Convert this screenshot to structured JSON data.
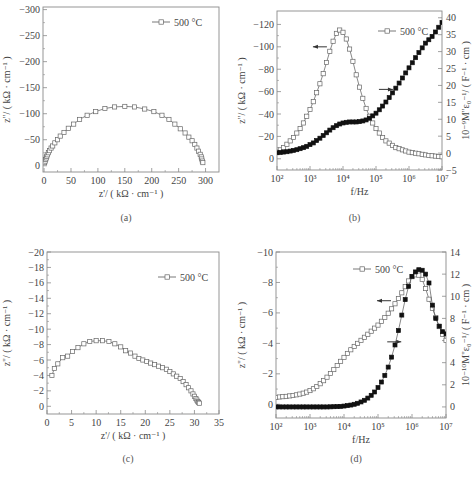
{
  "figure": {
    "captions": [
      "(a)",
      "(b)",
      "(c)",
      "(d)"
    ]
  },
  "chart_data": [
    {
      "id": "a",
      "type": "scatter",
      "title": "",
      "caption": "(a)",
      "xlabel": "z'/ ( kΩ · cm⁻¹ )",
      "ylabel": "z''/ ( kΩ · cm⁻¹ )",
      "xlim": [
        -2,
        325
      ],
      "ylim": [
        12,
        -305
      ],
      "xticks": [
        0,
        50,
        100,
        150,
        200,
        250,
        300
      ],
      "xtick_labels": [
        "0",
        "50",
        "100",
        "150",
        "200",
        "250",
        "300"
      ],
      "yticks": [
        0,
        -50,
        -100,
        -150,
        -200,
        -250,
        -300
      ],
      "ytick_labels": [
        "0",
        "−50",
        "−100",
        "−150",
        "−200",
        "−250",
        "−300"
      ],
      "grid": false,
      "legend": {
        "position": "upper right",
        "entries": [
          "500 °C"
        ]
      },
      "series": [
        {
          "name": "500 °C",
          "marker": "open-square",
          "x": [
            1,
            2,
            3,
            4,
            5,
            6,
            8,
            10,
            13,
            16,
            20,
            25,
            30,
            37,
            45,
            55,
            66,
            80,
            96,
            113,
            131,
            150,
            168,
            187,
            204,
            219,
            232,
            243,
            253,
            262,
            269,
            275,
            280,
            284,
            287,
            290,
            292,
            293,
            294,
            295
          ],
          "y": [
            -6,
            -9,
            -12,
            -15,
            -18,
            -21,
            -25,
            -29,
            -34,
            -38,
            -44,
            -50,
            -57,
            -64,
            -72,
            -80,
            -89,
            -97,
            -104,
            -110,
            -113,
            -114,
            -113,
            -109,
            -104,
            -97,
            -89,
            -80,
            -71,
            -63,
            -55,
            -48,
            -41,
            -34,
            -28,
            -22,
            -17,
            -13,
            -9,
            -6
          ]
        }
      ]
    },
    {
      "id": "b",
      "type": "line",
      "title": "",
      "caption": "(b)",
      "xlabel": "f/Hz",
      "xscale": "log",
      "ylabel": "z''/ ( kΩ · cm⁻¹ )",
      "ylabel_right": "10⁻⁹M''ε₀⁻¹/ ( F⁻¹ · cm )",
      "xlim": [
        100,
        10000000
      ],
      "xticks": [
        100,
        1000,
        10000,
        100000,
        1000000,
        10000000
      ],
      "xtick_labels": [
        "10²",
        "10³",
        "10⁴",
        "10⁵",
        "10⁶",
        "10⁷"
      ],
      "ylim": [
        10,
        -132
      ],
      "yticks": [
        0,
        -20,
        -40,
        -60,
        -80,
        -100,
        -120
      ],
      "ytick_labels": [
        "0",
        "−20",
        "−40",
        "−60",
        "−80",
        "−100",
        "−120"
      ],
      "ylim_right": [
        -5,
        42
      ],
      "yticks_right": [
        -5,
        0,
        5,
        10,
        15,
        20,
        25,
        30,
        35,
        40
      ],
      "ytick_labels_right": [
        "−5",
        "0",
        "5",
        "10",
        "15",
        "20",
        "25",
        "30",
        "35",
        "40"
      ],
      "grid": false,
      "legend": {
        "position": "upper right",
        "entries": [
          "500 °C"
        ]
      },
      "annotations": [
        {
          "text": "←",
          "desc": "arrow pointing to left axis (Z'' curve)",
          "at": [
            2000,
            -100
          ]
        },
        {
          "text": "→",
          "desc": "arrow pointing to right axis (M'' curve)",
          "at": [
            200000,
            -62
          ]
        }
      ],
      "series": [
        {
          "name": "Z'' (500 °C)",
          "axis": "left",
          "marker": "open-square",
          "log10f": [
            2.0,
            2.1,
            2.2,
            2.3,
            2.4,
            2.5,
            2.6,
            2.7,
            2.8,
            2.9,
            3.0,
            3.1,
            3.2,
            3.3,
            3.4,
            3.5,
            3.6,
            3.7,
            3.8,
            3.9,
            4.0,
            4.1,
            4.2,
            4.3,
            4.4,
            4.5,
            4.6,
            4.7,
            4.8,
            4.9,
            5.0,
            5.1,
            5.2,
            5.3,
            5.4,
            5.5,
            5.6,
            5.7,
            5.8,
            5.9,
            6.0,
            6.1,
            6.2,
            6.3,
            6.4,
            6.5,
            6.6,
            6.7,
            6.8,
            6.9,
            7.0
          ],
          "y": [
            -6,
            -8,
            -10,
            -13,
            -16,
            -19,
            -23,
            -27,
            -32,
            -38,
            -44,
            -51,
            -59,
            -67,
            -76,
            -86,
            -96,
            -105,
            -112,
            -115,
            -113,
            -107,
            -98,
            -87,
            -75,
            -64,
            -54,
            -45,
            -38,
            -32,
            -27,
            -23,
            -19,
            -16,
            -14,
            -12,
            -10,
            -9,
            -8,
            -7,
            -6,
            -5.5,
            -5,
            -4.5,
            -4,
            -3.5,
            -3,
            -2.7,
            -2.4,
            -2.1,
            -1.8
          ]
        },
        {
          "name": "M'' (500 °C)",
          "axis": "right",
          "marker": "filled-square",
          "log10f": [
            2.0,
            2.1,
            2.2,
            2.3,
            2.4,
            2.5,
            2.6,
            2.7,
            2.8,
            2.9,
            3.0,
            3.1,
            3.2,
            3.3,
            3.4,
            3.5,
            3.6,
            3.7,
            3.8,
            3.9,
            4.0,
            4.1,
            4.2,
            4.3,
            4.4,
            4.5,
            4.6,
            4.7,
            4.8,
            4.9,
            5.0,
            5.1,
            5.2,
            5.3,
            5.4,
            5.5,
            5.6,
            5.7,
            5.8,
            5.9,
            6.0,
            6.1,
            6.2,
            6.3,
            6.4,
            6.5,
            6.6,
            6.7,
            6.8,
            6.9,
            7.0
          ],
          "y": [
            0.1,
            0.2,
            0.3,
            0.4,
            0.6,
            0.8,
            1.0,
            1.3,
            1.6,
            2.0,
            2.5,
            3.0,
            3.7,
            4.4,
            5.2,
            6.0,
            6.8,
            7.5,
            8.1,
            8.6,
            8.9,
            9.1,
            9.2,
            9.2,
            9.2,
            9.3,
            9.5,
            9.8,
            10.3,
            11.0,
            11.8,
            12.8,
            13.9,
            15.1,
            16.4,
            17.8,
            19.2,
            20.7,
            22.2,
            23.7,
            25.2,
            26.7,
            28.2,
            29.7,
            31.1,
            32.5,
            33.5,
            34.5,
            35.8,
            37.2,
            38.6
          ]
        }
      ]
    },
    {
      "id": "c",
      "type": "scatter",
      "title": "",
      "caption": "(c)",
      "xlabel": "z'/ ( kΩ · cm⁻¹ )",
      "ylabel": "z''/ ( kΩ · cm⁻¹ )",
      "xlim": [
        0,
        35
      ],
      "ylim": [
        1,
        -20
      ],
      "xticks": [
        0,
        5,
        10,
        15,
        20,
        25,
        30,
        35
      ],
      "xtick_labels": [
        "0",
        "5",
        "10",
        "15",
        "20",
        "25",
        "30",
        "35"
      ],
      "yticks": [
        0,
        -2,
        -4,
        -6,
        -8,
        -10,
        -12,
        -14,
        -16,
        -18,
        -20
      ],
      "ytick_labels": [
        "0",
        "−2",
        "−4",
        "−6",
        "−8",
        "−10",
        "−12",
        "−14",
        "−16",
        "−18",
        "−20"
      ],
      "grid": false,
      "legend": {
        "position": "upper right",
        "entries": [
          "500 °C"
        ]
      },
      "series": [
        {
          "name": "500 °C",
          "marker": "open-square",
          "x": [
            1.0,
            1.5,
            2.2,
            3.2,
            4.2,
            5.2,
            6.3,
            7.5,
            8.7,
            10.0,
            11.3,
            12.6,
            13.8,
            15.0,
            16.0,
            17.0,
            17.9,
            18.7,
            19.5,
            20.3,
            21.1,
            21.9,
            22.7,
            23.5,
            24.3,
            25.0,
            25.7,
            26.4,
            27.1,
            27.7,
            28.3,
            28.8,
            29.3,
            29.7,
            30.0,
            30.3,
            30.5,
            30.7,
            30.85,
            31.0
          ],
          "y": [
            -4.0,
            -4.9,
            -5.5,
            -6.3,
            -6.5,
            -7.1,
            -7.6,
            -8.1,
            -8.4,
            -8.5,
            -8.5,
            -8.4,
            -8.1,
            -7.7,
            -7.2,
            -6.9,
            -6.5,
            -6.2,
            -6.0,
            -5.8,
            -5.6,
            -5.4,
            -5.2,
            -5.0,
            -4.8,
            -4.5,
            -4.2,
            -3.9,
            -3.6,
            -3.2,
            -2.8,
            -2.4,
            -2.0,
            -1.6,
            -1.3,
            -1.0,
            -0.8,
            -0.6,
            -0.5,
            -0.4
          ]
        }
      ]
    },
    {
      "id": "d",
      "type": "line",
      "title": "",
      "caption": "(d)",
      "xlabel": "f/Hz",
      "xscale": "log",
      "ylabel": "z''/ ( kΩ · cm⁻¹ )",
      "ylabel_right": "10⁻¹⁰M''ε₀⁻¹/ ( F⁻¹ · cm )",
      "xlim": [
        100,
        10000000
      ],
      "xticks": [
        100,
        1000,
        10000,
        100000,
        1000000,
        10000000
      ],
      "xtick_labels": [
        "10²",
        "10³",
        "10⁴",
        "10⁵",
        "10⁶",
        "10⁷"
      ],
      "ylim": [
        0.9,
        -10
      ],
      "yticks": [
        0,
        -2,
        -4,
        -6,
        -8,
        -10
      ],
      "ytick_labels": [
        "0",
        "−2",
        "−4",
        "−6",
        "−8",
        "−10"
      ],
      "ylim_right": [
        -1,
        14
      ],
      "yticks_right": [
        0,
        2,
        4,
        6,
        8,
        10,
        12,
        14
      ],
      "ytick_labels_right": [
        "0",
        "2",
        "4",
        "6",
        "8",
        "10",
        "12",
        "14"
      ],
      "grid": false,
      "legend": {
        "position": "upper center",
        "entries": [
          "500 °C"
        ]
      },
      "annotations": [
        {
          "text": "←",
          "desc": "arrow pointing to left axis (Z'' curve)",
          "at": [
            150000,
            -6.8
          ]
        },
        {
          "text": "→",
          "desc": "arrow pointing to right axis (M'' curve)",
          "at": [
            300000,
            -4.1
          ]
        }
      ],
      "series": [
        {
          "name": "Z'' (500 °C)",
          "axis": "left",
          "marker": "open-square",
          "log10f": [
            2.0,
            2.1,
            2.2,
            2.3,
            2.4,
            2.5,
            2.6,
            2.7,
            2.8,
            2.9,
            3.0,
            3.1,
            3.2,
            3.3,
            3.4,
            3.5,
            3.6,
            3.7,
            3.8,
            3.9,
            4.0,
            4.1,
            4.2,
            4.3,
            4.4,
            4.5,
            4.6,
            4.7,
            4.8,
            4.9,
            5.0,
            5.1,
            5.2,
            5.3,
            5.4,
            5.5,
            5.6,
            5.7,
            5.8,
            5.9,
            6.0,
            6.1,
            6.2,
            6.3,
            6.4,
            6.5,
            6.6,
            6.7,
            6.8,
            6.9,
            7.0
          ],
          "y": [
            -0.45,
            -0.48,
            -0.5,
            -0.52,
            -0.55,
            -0.58,
            -0.62,
            -0.67,
            -0.73,
            -0.8,
            -0.9,
            -1.02,
            -1.17,
            -1.35,
            -1.55,
            -1.78,
            -2.02,
            -2.28,
            -2.55,
            -2.82,
            -3.08,
            -3.34,
            -3.58,
            -3.8,
            -4.0,
            -4.2,
            -4.4,
            -4.6,
            -4.8,
            -5.0,
            -5.2,
            -5.45,
            -5.7,
            -5.98,
            -6.27,
            -6.6,
            -6.95,
            -7.32,
            -7.72,
            -8.1,
            -8.38,
            -8.5,
            -8.48,
            -8.2,
            -7.6,
            -6.9,
            -6.3,
            -5.7,
            -5.1,
            -4.6,
            -4.2
          ]
        },
        {
          "name": "M'' (500 °C)",
          "axis": "right",
          "marker": "filled-square",
          "log10f": [
            2.0,
            2.1,
            2.2,
            2.3,
            2.4,
            2.5,
            2.6,
            2.7,
            2.8,
            2.9,
            3.0,
            3.1,
            3.2,
            3.3,
            3.4,
            3.5,
            3.6,
            3.7,
            3.8,
            3.9,
            4.0,
            4.1,
            4.2,
            4.3,
            4.4,
            4.5,
            4.6,
            4.7,
            4.8,
            4.9,
            5.0,
            5.1,
            5.2,
            5.3,
            5.4,
            5.5,
            5.6,
            5.7,
            5.8,
            5.9,
            6.0,
            6.1,
            6.2,
            6.3,
            6.4,
            6.5,
            6.6,
            6.7,
            6.8,
            6.9,
            7.0
          ],
          "y": [
            0,
            0,
            0,
            0,
            0,
            0,
            0,
            0,
            0,
            0,
            0,
            0,
            0,
            0,
            0,
            0,
            0.01,
            0.02,
            0.03,
            0.05,
            0.08,
            0.12,
            0.17,
            0.24,
            0.33,
            0.45,
            0.6,
            0.8,
            1.05,
            1.35,
            1.75,
            2.25,
            2.85,
            3.6,
            4.5,
            5.6,
            6.9,
            8.3,
            9.7,
            10.9,
            11.8,
            12.2,
            12.4,
            12.35,
            12.0,
            11.2,
            9.2,
            8.0,
            7.3,
            6.8,
            6.6
          ]
        }
      ]
    }
  ]
}
